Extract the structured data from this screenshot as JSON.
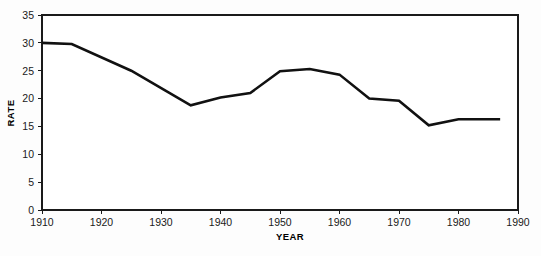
{
  "chart_data": {
    "type": "line",
    "title": "",
    "xlabel": "YEAR",
    "ylabel": "RATE",
    "xlim": [
      1910,
      1990
    ],
    "ylim": [
      0,
      35
    ],
    "xticks": [
      1910,
      1920,
      1930,
      1940,
      1950,
      1960,
      1970,
      1980,
      1990
    ],
    "yticks": [
      0,
      5,
      10,
      15,
      20,
      25,
      30,
      35
    ],
    "xtick_labels": [
      "1910",
      "1920",
      "1930",
      "1940",
      "1950",
      "1960",
      "1970",
      "1980",
      "1990"
    ],
    "ytick_labels": [
      "0",
      "5",
      "10",
      "15",
      "20",
      "25",
      "30",
      "35"
    ],
    "grid": "horizontal",
    "legend": "none",
    "series": [
      {
        "name": "Rate",
        "color": "#111111",
        "x": [
          1910,
          1915,
          1925,
          1935,
          1940,
          1945,
          1950,
          1955,
          1960,
          1965,
          1970,
          1975,
          1980,
          1987
        ],
        "values": [
          30.0,
          29.8,
          25.0,
          18.8,
          20.2,
          21.0,
          24.9,
          25.3,
          24.3,
          20.0,
          19.6,
          15.2,
          16.3,
          16.3
        ]
      }
    ]
  },
  "axes": {
    "y_title": "RATE",
    "x_title": "YEAR"
  },
  "colors": {
    "line": "#111111",
    "grid": "#8c8c8c",
    "frame": "#1a1a1a",
    "plot_background": "#ffffff",
    "page_background": "#fdfdfd"
  }
}
